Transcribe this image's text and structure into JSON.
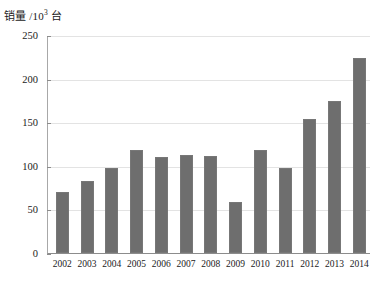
{
  "chart_data": {
    "type": "bar",
    "title": "",
    "ylabel": "销量 /10³ 台",
    "ylabel_parts": {
      "text_before": "销量 /10",
      "superscript": "3",
      "text_after": " 台"
    },
    "xlabel": "",
    "categories": [
      "2002",
      "2003",
      "2004",
      "2005",
      "2006",
      "2007",
      "2008",
      "2009",
      "2010",
      "2011",
      "2012",
      "2013",
      "2014"
    ],
    "values": [
      70,
      83,
      97,
      118,
      110,
      112,
      111,
      59,
      118,
      98,
      154,
      174,
      224
    ],
    "ylim": [
      0,
      250
    ],
    "yticks": [
      0,
      50,
      100,
      150,
      200,
      250
    ],
    "ytick_labels": [
      "0",
      "50",
      "100",
      "150",
      "200",
      "250"
    ],
    "grid": true,
    "grid_axis": "y",
    "legend": false,
    "bar_color": "#6e6e6e",
    "grid_color": "#e3e3e3",
    "axis_color": "#8c8c8c",
    "background_color": "#ffffff"
  }
}
